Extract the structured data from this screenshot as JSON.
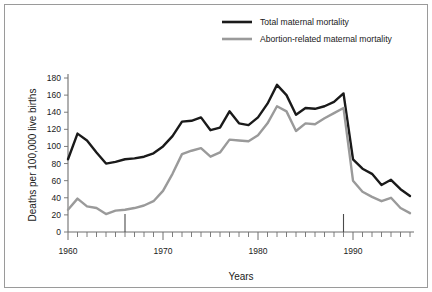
{
  "chart_data": {
    "type": "line",
    "title": "",
    "xlabel": "Years",
    "ylabel": "Deaths per 100,000 live births",
    "xlim": [
      1960,
      1996
    ],
    "ylim": [
      0,
      180
    ],
    "ytick_step": 20,
    "xtick_step": 1,
    "xtick_label_step": 10,
    "grid": false,
    "legend_position": "top-center",
    "x": [
      1960,
      1961,
      1962,
      1963,
      1964,
      1965,
      1966,
      1967,
      1968,
      1969,
      1970,
      1971,
      1972,
      1973,
      1974,
      1975,
      1976,
      1977,
      1978,
      1979,
      1980,
      1981,
      1982,
      1983,
      1984,
      1985,
      1986,
      1987,
      1988,
      1989,
      1990,
      1991,
      1992,
      1993,
      1994,
      1995,
      1996
    ],
    "xtick_labels": [
      "1960",
      "1970",
      "1980",
      "1990"
    ],
    "xtick_label_values": [
      1960,
      1970,
      1980,
      1990
    ],
    "ytick_labels": [
      "0",
      "20",
      "40",
      "60",
      "80",
      "100",
      "120",
      "140",
      "160",
      "180"
    ],
    "ytick_values": [
      0,
      20,
      40,
      60,
      80,
      100,
      120,
      140,
      160,
      180
    ],
    "series": [
      {
        "name": "Total maternal mortality",
        "color": "#1a1a1a",
        "values": [
          85,
          115,
          107,
          93,
          80,
          82,
          85,
          86,
          88,
          92,
          100,
          112,
          129,
          130,
          134,
          119,
          122,
          141,
          127,
          125,
          134,
          150,
          172,
          160,
          137,
          145,
          144,
          147,
          152,
          162,
          85,
          74,
          68,
          55,
          61,
          50,
          42
        ]
      },
      {
        "name": "Abortion-related maternal mortality",
        "color": "#9a9a9a",
        "values": [
          26,
          39,
          30,
          28,
          21,
          25,
          26,
          28,
          31,
          36,
          48,
          68,
          91,
          95,
          98,
          88,
          93,
          108,
          107,
          106,
          113,
          127,
          147,
          141,
          118,
          127,
          126,
          133,
          139,
          145,
          60,
          47,
          41,
          36,
          40,
          28,
          22
        ]
      }
    ],
    "markers": [
      {
        "name": "marker-1966",
        "x": 1966
      },
      {
        "name": "marker-1989",
        "x": 1989
      }
    ]
  },
  "legend": {
    "items": [
      {
        "label": "Total maternal mortality",
        "color": "#1a1a1a"
      },
      {
        "label": "Abortion-related maternal mortality",
        "color": "#9a9a9a"
      }
    ]
  },
  "axes": {
    "x_title": "Years",
    "y_title": "Deaths per 100,000 live births"
  }
}
